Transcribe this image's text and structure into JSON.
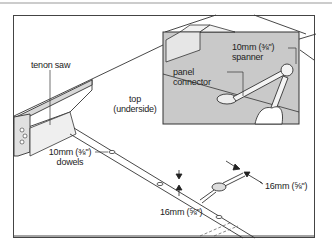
{
  "diagram": {
    "type": "technical-illustration",
    "colors": {
      "line": "#333333",
      "panel_grey": "#c9c9c9",
      "saw_grey": "#d8d8d8",
      "background": "#ffffff",
      "top_rule": "#bbbbbb"
    },
    "labels": {
      "tenon_saw": "tenon saw",
      "top_line1": "top",
      "top_line2": "(underside)",
      "dowels_line1": "10mm (⅜\")",
      "dowels_line2": "dowels",
      "spanner_line1": "10mm (⅜\")",
      "spanner_line2": "spanner",
      "connector_line1": "panel",
      "connector_line2": "connector",
      "dim_right": "16mm (⅝\")",
      "dim_left": "16mm (⅝\")"
    },
    "inset": {
      "title": "detail: tightening panel connector with spanner"
    }
  }
}
